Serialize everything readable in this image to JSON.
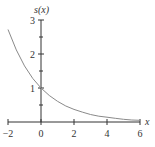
{
  "chart_data": {
    "type": "line",
    "title": "",
    "xlabel": "x",
    "ylabel": "s(x)",
    "xlim": [
      -2,
      6
    ],
    "ylim": [
      0,
      3
    ],
    "x_ticks": [
      -2,
      0,
      2,
      4,
      6
    ],
    "x_tick_labels": [
      "−2",
      "0",
      "2",
      "4",
      "6"
    ],
    "y_ticks": [
      1,
      2,
      3
    ],
    "y_tick_labels": [
      "1",
      "2",
      "3"
    ],
    "y_minor_ticks": [
      0.5,
      1.5,
      2.5
    ],
    "grid": false,
    "legend": null,
    "series": [
      {
        "name": "s(x)",
        "color": "#8a8a8a",
        "x": [
          -2,
          -1.5,
          -1,
          -0.5,
          0,
          0.5,
          1,
          1.5,
          2,
          2.5,
          3,
          3.5,
          4,
          4.5,
          5,
          5.5,
          6
        ],
        "y": [
          2.72,
          2.12,
          1.65,
          1.28,
          1.0,
          0.78,
          0.61,
          0.47,
          0.37,
          0.29,
          0.22,
          0.17,
          0.14,
          0.11,
          0.08,
          0.06,
          0.05
        ]
      }
    ]
  },
  "axes": {
    "x_label": "x",
    "y_label": "s(x)"
  }
}
